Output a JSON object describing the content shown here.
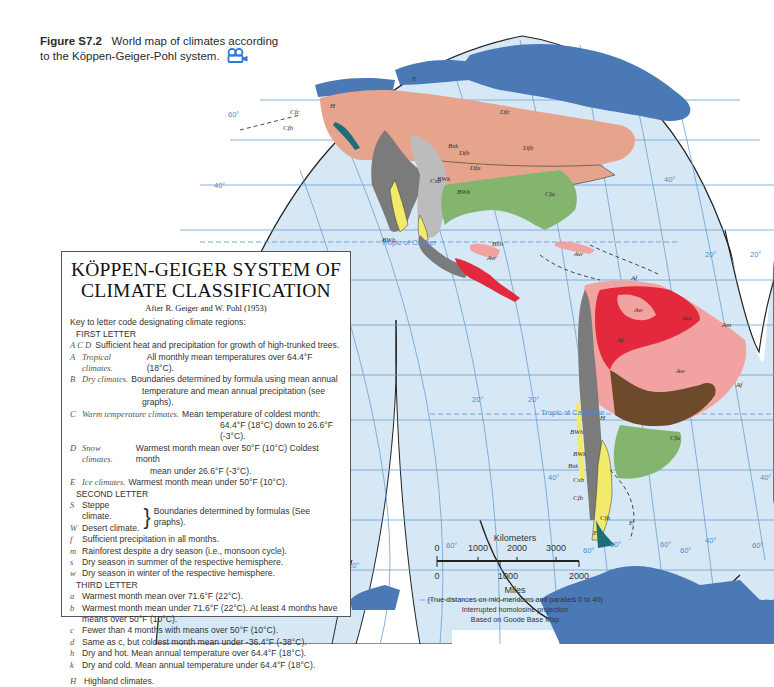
{
  "caption": {
    "figure_label": "Figure S7.2",
    "text_line1": "World map of climates according",
    "text_line2": "to the Köppen-Geiger-Pohl system.",
    "icon": "video-camera-icon"
  },
  "legend": {
    "title_line1": "KÖPPEN-GEIGER SYSTEM OF",
    "title_line2": "CLIMATE CLASSIFICATION",
    "subtitle": "After R. Geiger and W. Pohl (1953)",
    "intro": "Key to letter code designating climate regions:",
    "first_letter": {
      "heading": "FIRST LETTER",
      "items": [
        {
          "code": "A  C  D",
          "name": "",
          "desc": "Sufficient heat and precipitation for growth of high-trunked trees."
        },
        {
          "code": "A",
          "name": "Tropical climates.",
          "desc": "All monthly mean temperatures over 64.4°F (18°C)."
        },
        {
          "code": "B",
          "name": "Dry climates.",
          "desc": "Boundaries determined by formula using mean annual",
          "desc2": "temperature and mean annual precipitation (see graphs)."
        },
        {
          "code": "C",
          "name": "Warm temperature climates.",
          "desc": "Mean temperature of coldest month:",
          "desc2": "64.4°F (18°C) down to 26.6°F (-3°C)."
        },
        {
          "code": "D",
          "name": "Snow climates.",
          "desc": "Warmest month mean over 50°F (10°C) Coldest month",
          "desc2": "mean under 26.6°F (-3°C)."
        },
        {
          "code": "E",
          "name": "Ice climates.",
          "desc": "Warmest month mean under 50°F (10°C)."
        }
      ]
    },
    "second_letter": {
      "heading": "SECOND LETTER",
      "S": {
        "code": "S",
        "desc": "Steppe climate."
      },
      "W": {
        "code": "W",
        "desc": "Desert climate."
      },
      "brace_note": "Boundaries determined by formulas (See graphs).",
      "items": [
        {
          "code": "f",
          "desc": "Sufficient precipitation in all months."
        },
        {
          "code": "m",
          "desc": "Rainforest despite a dry season (i.e., monsoon cycle)."
        },
        {
          "code": "s",
          "desc": "Dry season in summer of the respective hemisphere."
        },
        {
          "code": "w",
          "desc": "Dry season in winter of the respective hemisphere."
        }
      ]
    },
    "third_letter": {
      "heading": "THIRD LETTER",
      "items": [
        {
          "code": "a",
          "desc": "Warmest month mean over 71.6°F (22°C)."
        },
        {
          "code": "b",
          "desc": "Warmest month mean under 71.6°F (22°C).  At least 4 months have",
          "desc2": "means over 50°F (10°C)."
        },
        {
          "code": "c",
          "desc": "Fewer than 4 months with means over 50°F (10°C)."
        },
        {
          "code": "d",
          "desc": "Same as c, but coldest month mean under -36.4°F (-38°C)."
        },
        {
          "code": "h",
          "desc": "Dry and hot.  Mean annual temperature over 64.4°F (18°C)."
        },
        {
          "code": "k",
          "desc": "Dry and cold.  Mean annual temperature under 64.4°F (18°C)."
        }
      ]
    },
    "highland": {
      "code": "H",
      "desc": "Highland climates."
    }
  },
  "scale": {
    "km_label": "Kilometers",
    "km_ticks": [
      "0",
      "1000",
      "2000",
      "3000"
    ],
    "mi_ticks": [
      "0",
      "1000",
      "2000"
    ],
    "mi_label": "Miles",
    "note1": "(True distances on mid-meridians and parallels 0 to 40)",
    "note2": "Interrupted homolosine projection",
    "note3": "Based on Goode Base Map"
  },
  "map": {
    "latitude_labels": [
      "60°",
      "40°",
      "20°",
      "20°",
      "20°",
      "20°",
      "40°",
      "40°",
      "60°",
      "60°",
      "60°",
      "60°"
    ],
    "longitude_labels": [
      "120°",
      "80°",
      "60°",
      "40°"
    ],
    "tropic_cancer": "Tropic of Cancer",
    "tropic_capricorn": "Tropic of Capricorn",
    "region_labels": [
      "E",
      "H",
      "Cfc",
      "Cfb",
      "Dfc",
      "Dfb",
      "Dfa",
      "Bsk",
      "BWk",
      "Csb",
      "Cfa",
      "BWh",
      "BSh",
      "Cf",
      "Aw",
      "Am",
      "Af",
      "Cw",
      "Cfa",
      "Csb",
      "Cfb",
      "E"
    ],
    "colors": {
      "ocean": "#d6e8f6",
      "grid": "#6a9fd0",
      "ice": "#4b79b6",
      "snow_dfc": "#e7a48d",
      "temperate_cfa": "#84b56e",
      "highland": "#7b7b7b",
      "steppe": "#bcbcbc",
      "desert": "#f1ea6a",
      "tropical_af": "#e3293b",
      "savanna_aw": "#f2a2a0",
      "cw_brown": "#6c4a2a",
      "coastal_teal": "#1e6d78"
    }
  }
}
